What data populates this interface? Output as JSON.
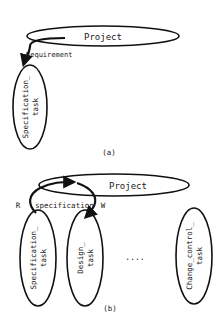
{
  "diagram_a": {
    "caption": "(a)",
    "parent": {
      "label": "Project"
    },
    "relation": {
      "label": "Requirement"
    },
    "children": [
      {
        "line1": "Specification_",
        "line2": "task"
      }
    ]
  },
  "diagram_b": {
    "caption": "(b)",
    "parent": {
      "label": "Project"
    },
    "relation": {
      "label": "specification",
      "read_marker": "R",
      "write_marker": "W"
    },
    "children": [
      {
        "line1": "Specification_",
        "line2": "task"
      },
      {
        "line1": "Design_",
        "line2": "task"
      },
      {
        "line1": "Change_control_",
        "line2": "task"
      }
    ],
    "ellipsis": "...."
  }
}
